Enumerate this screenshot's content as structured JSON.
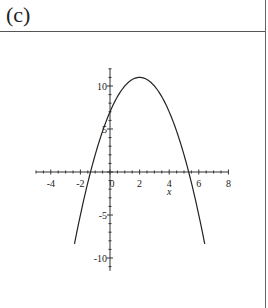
{
  "panel": {
    "label": "(c)"
  },
  "chart_data": {
    "type": "line",
    "title": "",
    "function": "f(x) = -(x-2)^2 + 11",
    "xlabel": "x",
    "ylabel": "",
    "xlim": [
      -5,
      8
    ],
    "ylim": [
      -10,
      11
    ],
    "x_ticks": [
      "-4",
      "-2",
      "0",
      "2",
      "4",
      "6",
      "8"
    ],
    "y_ticks": [
      "10",
      "5",
      "-5",
      "-10"
    ],
    "grid": false,
    "series": [
      {
        "name": "parabola",
        "x": [
          -2.4,
          -2,
          -1.32,
          -1,
          0,
          1,
          2,
          3,
          4,
          5,
          5.32,
          6,
          6.4
        ],
        "y": [
          -8.36,
          -5,
          0,
          2,
          7,
          10,
          11,
          10,
          7,
          2,
          0,
          -5,
          -8.36
        ]
      }
    ],
    "vertex": [
      2,
      11
    ],
    "roots": [
      -1.32,
      5.32
    ]
  }
}
